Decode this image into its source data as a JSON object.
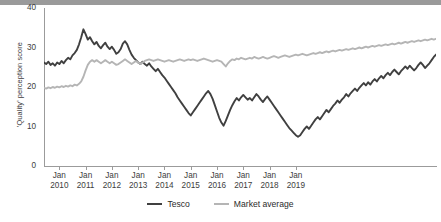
{
  "chart_data": {
    "type": "line",
    "title": "",
    "xlabel": "",
    "ylabel": "'Quality' perception score",
    "ylim": [
      0,
      40
    ],
    "yticks": [
      0,
      10,
      20,
      30,
      40
    ],
    "grid": false,
    "legend_position": "bottom",
    "xtick_labels": [
      {
        "month": "Jan",
        "year": "2010"
      },
      {
        "month": "Jan",
        "year": "2011"
      },
      {
        "month": "Jan",
        "year": "2012"
      },
      {
        "month": "Jan",
        "year": "2013"
      },
      {
        "month": "Jan",
        "year": "2014"
      },
      {
        "month": "Jan",
        "year": "2015"
      },
      {
        "month": "Jan",
        "year": "2016"
      },
      {
        "month": "Jan",
        "year": "2017"
      },
      {
        "month": "Jan",
        "year": "2018"
      },
      {
        "month": "Jan",
        "year": "2019"
      }
    ],
    "x_start": "2009-06",
    "x_end": "2019-12",
    "colors": {
      "tesco": "#404040",
      "market_average": "#b5b5b5",
      "axis": "#9b9b9b",
      "text": "#3d3d3d"
    },
    "series": [
      {
        "name": "Tesco",
        "color": "#404040",
        "values": [
          26.2,
          25.8,
          26.4,
          25.6,
          26.0,
          25.4,
          26.2,
          25.8,
          26.6,
          26.0,
          26.8,
          27.4,
          27.0,
          28.0,
          28.6,
          29.4,
          30.8,
          32.6,
          34.6,
          33.4,
          32.0,
          32.6,
          31.6,
          30.8,
          31.4,
          30.4,
          29.8,
          30.6,
          31.2,
          30.2,
          29.6,
          30.2,
          29.4,
          28.4,
          28.8,
          29.6,
          31.0,
          31.6,
          30.8,
          29.4,
          28.2,
          27.4,
          26.8,
          26.2,
          25.8,
          26.4,
          25.8,
          25.4,
          26.0,
          25.2,
          24.6,
          24.0,
          24.6,
          23.8,
          23.0,
          22.4,
          21.6,
          20.8,
          20.0,
          19.2,
          18.4,
          17.4,
          16.6,
          15.8,
          15.0,
          14.2,
          13.4,
          12.8,
          13.6,
          14.4,
          15.2,
          16.0,
          16.8,
          17.6,
          18.4,
          19.0,
          18.2,
          17.0,
          15.4,
          13.8,
          12.2,
          11.0,
          10.2,
          11.4,
          12.8,
          14.2,
          15.4,
          16.4,
          17.2,
          16.6,
          17.4,
          18.0,
          17.4,
          16.8,
          17.2,
          16.6,
          17.4,
          18.2,
          17.6,
          16.8,
          16.2,
          17.0,
          17.6,
          16.8,
          16.0,
          15.2,
          14.4,
          13.6,
          12.8,
          12.0,
          11.2,
          10.4,
          9.6,
          9.0,
          8.4,
          7.8,
          7.4,
          7.8,
          8.6,
          9.4,
          10.0,
          9.4,
          10.2,
          11.0,
          11.8,
          12.4,
          11.8,
          12.6,
          13.4,
          14.2,
          13.6,
          14.4,
          15.2,
          15.8,
          16.6,
          16.0,
          16.8,
          17.4,
          18.2,
          17.6,
          18.4,
          19.0,
          19.6,
          19.0,
          19.8,
          20.4,
          21.0,
          20.4,
          21.2,
          20.6,
          21.4,
          22.0,
          21.4,
          22.2,
          22.8,
          22.2,
          23.0,
          23.6,
          23.0,
          23.8,
          24.4,
          23.8,
          23.2,
          24.0,
          24.6,
          25.2,
          24.6,
          25.4,
          24.8,
          24.2,
          24.8,
          25.6,
          26.2,
          25.6,
          24.8,
          25.4,
          26.0,
          26.8,
          27.6,
          28.2
        ]
      },
      {
        "name": "Market average",
        "color": "#b5b5b5",
        "values": [
          19.8,
          19.6,
          19.9,
          19.7,
          20.0,
          19.8,
          20.1,
          19.9,
          20.2,
          20.0,
          20.3,
          20.1,
          20.4,
          20.2,
          20.6,
          20.4,
          20.8,
          21.4,
          22.6,
          24.2,
          25.6,
          26.4,
          26.8,
          26.4,
          26.8,
          26.4,
          26.0,
          26.4,
          26.8,
          26.4,
          26.0,
          26.4,
          26.0,
          25.6,
          25.8,
          26.2,
          26.6,
          27.0,
          26.6,
          26.2,
          25.8,
          26.2,
          26.6,
          26.2,
          25.8,
          26.2,
          26.6,
          26.8,
          27.0,
          26.8,
          26.6,
          26.8,
          27.0,
          26.8,
          26.6,
          26.4,
          26.6,
          26.8,
          26.6,
          26.4,
          26.6,
          26.8,
          27.0,
          26.8,
          26.6,
          26.8,
          27.0,
          26.8,
          27.0,
          26.8,
          26.6,
          26.8,
          27.0,
          27.2,
          27.0,
          26.8,
          26.6,
          26.4,
          26.6,
          26.8,
          26.6,
          26.4,
          25.8,
          25.2,
          26.0,
          26.6,
          27.0,
          26.8,
          27.2,
          27.0,
          27.4,
          27.2,
          27.0,
          27.2,
          27.4,
          27.2,
          27.6,
          27.4,
          27.2,
          27.4,
          27.6,
          27.4,
          27.2,
          27.4,
          27.6,
          27.8,
          27.6,
          27.4,
          27.6,
          27.8,
          28.0,
          27.8,
          27.6,
          27.8,
          28.0,
          28.2,
          28.0,
          28.2,
          28.4,
          28.2,
          28.0,
          28.2,
          28.4,
          28.6,
          28.4,
          28.6,
          28.8,
          28.6,
          28.8,
          29.0,
          28.8,
          29.0,
          29.2,
          29.0,
          29.2,
          29.4,
          29.2,
          29.4,
          29.6,
          29.4,
          29.6,
          29.8,
          29.6,
          29.8,
          30.0,
          29.8,
          30.0,
          30.2,
          30.0,
          30.2,
          30.4,
          30.2,
          30.4,
          30.6,
          30.4,
          30.6,
          30.8,
          30.6,
          30.8,
          31.0,
          30.8,
          31.0,
          31.2,
          31.0,
          31.2,
          31.4,
          31.2,
          31.4,
          31.6,
          31.4,
          31.6,
          31.8,
          31.6,
          31.8,
          32.0,
          31.8,
          32.0,
          32.2,
          32.0,
          32.2
        ]
      }
    ]
  },
  "legend": {
    "items": [
      {
        "label": "Tesco",
        "color": "#404040"
      },
      {
        "label": "Market average",
        "color": "#b5b5b5"
      }
    ]
  }
}
